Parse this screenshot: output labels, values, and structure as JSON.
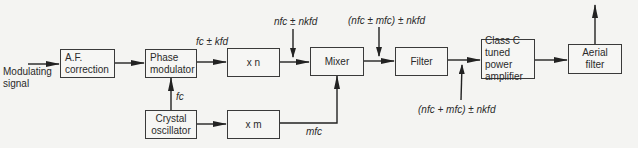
{
  "diagram": {
    "type": "block-diagram",
    "input_label": "Modulating\nsignal",
    "blocks": [
      {
        "id": "af",
        "label": "A.F.\ncorrection"
      },
      {
        "id": "pm",
        "label": "Phase\nmodulator"
      },
      {
        "id": "osc",
        "label": "Crystal\noscillator"
      },
      {
        "id": "xn",
        "label": "x n"
      },
      {
        "id": "xm",
        "label": "x m"
      },
      {
        "id": "mixer",
        "label": "Mixer"
      },
      {
        "id": "filter",
        "label": "Filter"
      },
      {
        "id": "pa",
        "label": "Class C\ntuned power\namplifier"
      },
      {
        "id": "aerial",
        "label": "Aerial\nfilter"
      }
    ],
    "signal_labels": {
      "fc": "fc",
      "pm_out": "fc ± kfd",
      "xn_out": "nfc ± nkfd",
      "xm_out": "mfc",
      "mixer_out": "(nfc ± mfc) ± nkfd",
      "filter_out": "(nfc + mfc) ± nkfd"
    },
    "edges": [
      {
        "from": "input",
        "to": "af"
      },
      {
        "from": "af",
        "to": "pm"
      },
      {
        "from": "osc",
        "to": "pm",
        "label": "fc"
      },
      {
        "from": "osc",
        "to": "xm"
      },
      {
        "from": "pm",
        "to": "xn",
        "label": "fc ± kfd"
      },
      {
        "from": "xn",
        "to": "mixer",
        "label": "nfc ± nkfd"
      },
      {
        "from": "xm",
        "to": "mixer",
        "label": "mfc"
      },
      {
        "from": "mixer",
        "to": "filter",
        "label": "(nfc ± mfc) ± nkfd"
      },
      {
        "from": "filter",
        "to": "pa",
        "label": "(nfc + mfc) ± nkfd"
      },
      {
        "from": "pa",
        "to": "aerial"
      },
      {
        "from": "aerial",
        "to": "output"
      }
    ]
  }
}
